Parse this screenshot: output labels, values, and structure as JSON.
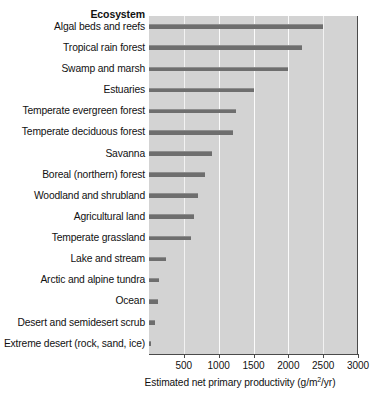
{
  "figure": {
    "top_cut_caption": "",
    "y_axis_title": "Ecosystem",
    "x_axis_title_prefix": "Estimated net primary productivity (g/m",
    "x_axis_title_sup": "2",
    "x_axis_title_suffix": "/yr)"
  },
  "chart_data": {
    "type": "bar",
    "orientation": "horizontal",
    "title": "",
    "xlabel": "Estimated net primary productivity (g/m2/yr)",
    "ylabel": "Ecosystem",
    "xlim": [
      0,
      3000
    ],
    "ylim": null,
    "grid": "vertical white gridlines at each 500 unit tick",
    "legend": "none",
    "xticks": [
      500,
      1000,
      1500,
      2000,
      2500,
      3000
    ],
    "xticklabels": [
      "500",
      "1000",
      "1500",
      "2000",
      "2500",
      "3000"
    ],
    "categories": [
      "Algal beds and reefs",
      "Tropical rain forest",
      "Swamp and marsh",
      "Estuaries",
      "Temperate evergreen forest",
      "Temperate deciduous forest",
      "Savanna",
      "Boreal (northern) forest",
      "Woodland and shrubland",
      "Agricultural land",
      "Temperate grassland",
      "Lake and stream",
      "Arctic and alpine tundra",
      "Ocean",
      "Desert and semidesert scrub",
      "Extreme desert (rock, sand, ice)"
    ],
    "values": [
      2500,
      2200,
      2000,
      1500,
      1250,
      1200,
      900,
      800,
      700,
      650,
      600,
      250,
      140,
      125,
      90,
      30
    ],
    "bar_color": "#6e6e6e",
    "plot_background": "#d3d3d3"
  }
}
